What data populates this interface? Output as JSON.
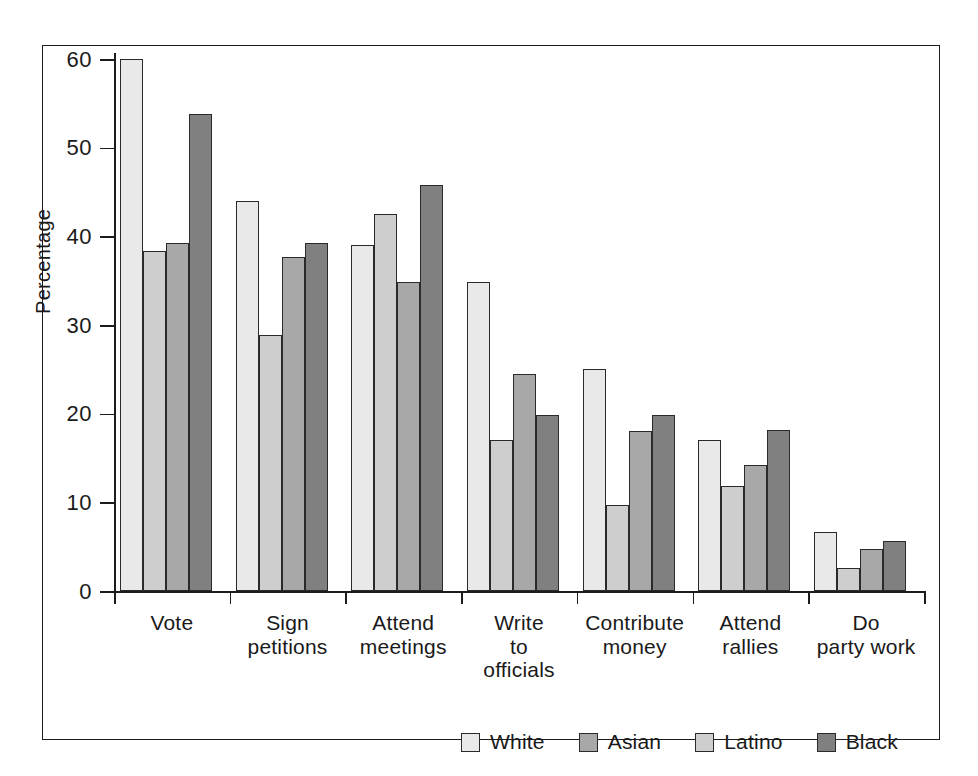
{
  "chart_data": {
    "type": "bar",
    "title": "",
    "subtitle": "",
    "xlabel": "",
    "ylabel": "Percentage",
    "ylim": [
      0,
      60
    ],
    "yticks": [
      0,
      10,
      20,
      30,
      40,
      50,
      60
    ],
    "ytick_labels": [
      "0",
      "10",
      "20",
      "30",
      "40",
      "50",
      "60"
    ],
    "grid": false,
    "legend_position": "bottom-center",
    "orientation": "vertical",
    "grouping": "grouped",
    "categories": [
      "Vote",
      "Sign petitions",
      "Attend meetings",
      "Write to officials",
      "Contribute money",
      "Attend rallies",
      "Do party work"
    ],
    "category_lines": [
      [
        "Vote"
      ],
      [
        "Sign",
        "petitions"
      ],
      [
        "Attend",
        "meetings"
      ],
      [
        "Write",
        "to",
        "officials"
      ],
      [
        "Contribute",
        "money"
      ],
      [
        "Attend",
        "rallies"
      ],
      [
        "Do",
        "party work"
      ]
    ],
    "series": [
      {
        "name": "White",
        "color": "#e9e9e9",
        "values": [
          60.0,
          44.0,
          39.0,
          34.8,
          25.0,
          17.0,
          6.7
        ]
      },
      {
        "name": "Latino",
        "color": "#cecece",
        "values": [
          38.3,
          28.9,
          42.5,
          17.0,
          9.7,
          11.8,
          2.6
        ]
      },
      {
        "name": "Asian",
        "color": "#a8a8a8",
        "values": [
          39.2,
          37.7,
          34.8,
          24.5,
          18.1,
          14.2,
          4.7
        ]
      },
      {
        "name": "Black",
        "color": "#808080",
        "values": [
          53.8,
          39.2,
          45.8,
          19.8,
          19.8,
          18.2,
          5.6
        ]
      }
    ]
  },
  "legend": {
    "entries": [
      {
        "label": "White",
        "swatch": "#e9e9e9"
      },
      {
        "label": "Asian",
        "swatch": "#a8a8a8"
      },
      {
        "label": "Latino",
        "swatch": "#cecece"
      },
      {
        "label": "Black",
        "swatch": "#808080"
      }
    ]
  }
}
